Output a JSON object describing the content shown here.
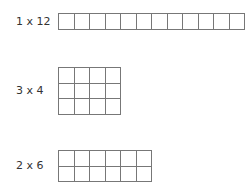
{
  "arrays": [
    {
      "label": "1 x 12",
      "rows": 1,
      "cols": 12,
      "top": 13,
      "label_top": 15
    },
    {
      "label": "3 x 4",
      "rows": 3,
      "cols": 4,
      "top": 67,
      "label_top": 84
    },
    {
      "label": "2 x 6",
      "rows": 2,
      "cols": 6,
      "top": 150,
      "label_top": 159
    }
  ],
  "style": {
    "line_color": "#777777",
    "cell_size": 15.5,
    "grid_left": 58
  }
}
